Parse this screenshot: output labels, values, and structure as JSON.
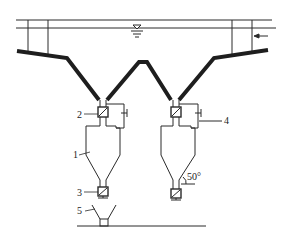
{
  "diagram": {
    "type": "settling-tank-with-cyclone-hoppers",
    "colors": {
      "line": "#2a2a2a",
      "thick": "#1e1e1e",
      "background": "#ffffff"
    },
    "labels": {
      "cyclone": "1",
      "upper_valve": "2",
      "lower_valve": "3",
      "bypass_pipe": "4",
      "receiving_funnel": "5",
      "cone_angle": "50°"
    },
    "symbols": {
      "water_level": "water-level-triangle",
      "inflow_arrow": "arrow-left"
    }
  }
}
